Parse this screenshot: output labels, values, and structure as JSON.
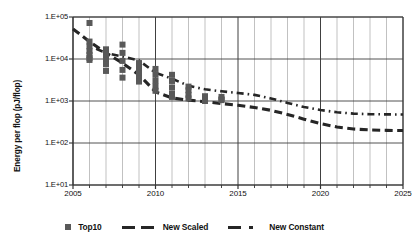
{
  "chart_data": {
    "type": "scatter",
    "title": "",
    "xlabel": "",
    "ylabel": "Energy per flop  (pJ/flop)",
    "xlim": [
      2005,
      2025
    ],
    "ylim": [
      10,
      100000
    ],
    "yscale": "log",
    "grid": true,
    "legend_position": "bottom",
    "y_ticks": [
      "1.E+05",
      "1.E+04",
      "1.E+03",
      "1.E+02",
      "1.E+01"
    ],
    "y_tick_values": [
      100000,
      10000,
      1000,
      100,
      10
    ],
    "x_ticks": [
      "2005",
      "2010",
      "2015",
      "2020",
      "2025"
    ],
    "x_tick_values": [
      2005,
      2010,
      2015,
      2020,
      2025
    ],
    "x_minor_step": 1,
    "colors": {
      "marker": "#595959",
      "line": "#262626",
      "grid": "#a6a6a6",
      "axis": "#404040",
      "background": "#ffffff"
    },
    "series": [
      {
        "name": "Top10",
        "type": "scatter",
        "marker": "square",
        "points": [
          {
            "x": 2006.0,
            "y": 72000
          },
          {
            "x": 2006.0,
            "y": 26000
          },
          {
            "x": 2006.0,
            "y": 20000
          },
          {
            "x": 2006.0,
            "y": 15500
          },
          {
            "x": 2006.0,
            "y": 12500
          },
          {
            "x": 2006.0,
            "y": 10500
          },
          {
            "x": 2006.0,
            "y": 9500
          },
          {
            "x": 2007.0,
            "y": 17000
          },
          {
            "x": 2007.0,
            "y": 13000
          },
          {
            "x": 2007.0,
            "y": 10000
          },
          {
            "x": 2007.0,
            "y": 7500
          },
          {
            "x": 2007.0,
            "y": 5200
          },
          {
            "x": 2008.0,
            "y": 22000
          },
          {
            "x": 2008.0,
            "y": 14000
          },
          {
            "x": 2008.0,
            "y": 9000
          },
          {
            "x": 2008.0,
            "y": 5500
          },
          {
            "x": 2008.0,
            "y": 3600
          },
          {
            "x": 2009.0,
            "y": 8000
          },
          {
            "x": 2009.0,
            "y": 6000
          },
          {
            "x": 2009.0,
            "y": 4500
          },
          {
            "x": 2009.0,
            "y": 3400
          },
          {
            "x": 2009.0,
            "y": 2900
          },
          {
            "x": 2010.0,
            "y": 5800
          },
          {
            "x": 2010.0,
            "y": 4200
          },
          {
            "x": 2010.0,
            "y": 3000
          },
          {
            "x": 2010.0,
            "y": 2200
          },
          {
            "x": 2010.0,
            "y": 1750
          },
          {
            "x": 2011.0,
            "y": 4200
          },
          {
            "x": 2011.0,
            "y": 3000
          },
          {
            "x": 2011.0,
            "y": 2100
          },
          {
            "x": 2011.0,
            "y": 1500
          },
          {
            "x": 2011.0,
            "y": 1250
          },
          {
            "x": 2012.0,
            "y": 2200
          },
          {
            "x": 2012.0,
            "y": 1800
          },
          {
            "x": 2012.0,
            "y": 1400
          },
          {
            "x": 2012.0,
            "y": 1150
          },
          {
            "x": 2013.0,
            "y": 1300
          },
          {
            "x": 2013.0,
            "y": 1100
          },
          {
            "x": 2013.0,
            "y": 1000
          },
          {
            "x": 2014.0,
            "y": 1250
          },
          {
            "x": 2014.0,
            "y": 1100
          },
          {
            "x": 2014.0,
            "y": 1050
          }
        ]
      },
      {
        "name": "New Scaled",
        "type": "line",
        "dash": "dashed",
        "points": [
          {
            "x": 2005,
            "y": 52000
          },
          {
            "x": 2006,
            "y": 26000
          },
          {
            "x": 2007,
            "y": 14000
          },
          {
            "x": 2008,
            "y": 8000
          },
          {
            "x": 2009,
            "y": 4200
          },
          {
            "x": 2010,
            "y": 1650
          },
          {
            "x": 2011,
            "y": 1180
          },
          {
            "x": 2012,
            "y": 1050
          },
          {
            "x": 2013,
            "y": 960
          },
          {
            "x": 2014,
            "y": 870
          },
          {
            "x": 2015,
            "y": 790
          },
          {
            "x": 2016,
            "y": 700
          },
          {
            "x": 2017,
            "y": 600
          },
          {
            "x": 2018,
            "y": 480
          },
          {
            "x": 2019,
            "y": 370
          },
          {
            "x": 2020,
            "y": 290
          },
          {
            "x": 2021,
            "y": 240
          },
          {
            "x": 2022,
            "y": 215
          },
          {
            "x": 2023,
            "y": 205
          },
          {
            "x": 2024,
            "y": 200
          },
          {
            "x": 2025,
            "y": 198
          }
        ]
      },
      {
        "name": "New Constant",
        "type": "line",
        "dash": "dashdot",
        "points": [
          {
            "x": 2006.4,
            "y": 17500
          },
          {
            "x": 2007.1,
            "y": 13500
          },
          {
            "x": 2008.0,
            "y": 11500
          },
          {
            "x": 2009.0,
            "y": 9200
          },
          {
            "x": 2010.0,
            "y": 4700
          },
          {
            "x": 2011.0,
            "y": 3400
          },
          {
            "x": 2012.0,
            "y": 2300
          },
          {
            "x": 2013.0,
            "y": 1900
          },
          {
            "x": 2014.0,
            "y": 1700
          },
          {
            "x": 2015.0,
            "y": 1550
          },
          {
            "x": 2016.0,
            "y": 1400
          },
          {
            "x": 2017.0,
            "y": 1150
          },
          {
            "x": 2018.0,
            "y": 900
          },
          {
            "x": 2019.0,
            "y": 720
          },
          {
            "x": 2020.0,
            "y": 610
          },
          {
            "x": 2021.0,
            "y": 540
          },
          {
            "x": 2022.0,
            "y": 500
          },
          {
            "x": 2023.0,
            "y": 485
          },
          {
            "x": 2024.0,
            "y": 480
          },
          {
            "x": 2025.0,
            "y": 478
          }
        ]
      }
    ]
  },
  "legend": {
    "items": [
      {
        "label": "Top10",
        "marker": "square"
      },
      {
        "label": "New Scaled",
        "marker": "dashed-line"
      },
      {
        "label": "New Constant",
        "marker": "dashdot-line"
      }
    ]
  }
}
